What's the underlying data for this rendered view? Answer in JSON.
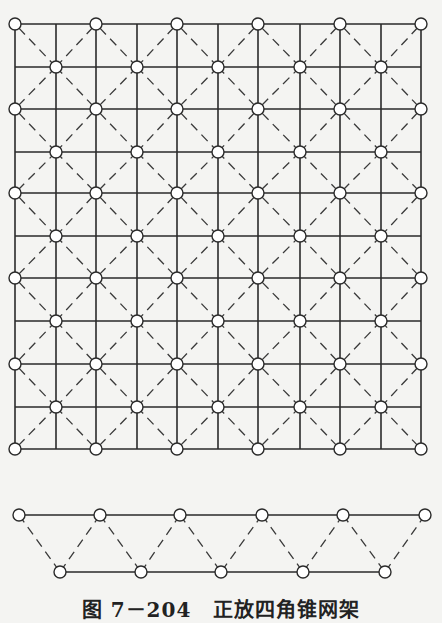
{
  "figure": {
    "caption_number": "图 7－204",
    "caption_title": "正放四角锥网架",
    "colors": {
      "line": "#2a2a2a",
      "node_fill": "#ffffff",
      "background": "#f4f4f2"
    }
  },
  "plan_view": {
    "description": "Plan view of square-pyramid space grid: upper chord grid (solid), lower chord nodes offset (inner), web members dashed",
    "outer_x": [
      15,
      96,
      177,
      258,
      340,
      421
    ],
    "outer_y": [
      24,
      109,
      193,
      278,
      364,
      449
    ],
    "inner_x": [
      56,
      137,
      218,
      300,
      381
    ],
    "inner_y": [
      67,
      152,
      236,
      321,
      407
    ],
    "node_radius": 6
  },
  "elevation_view": {
    "description": "Elevation of truss: top chord, bottom chord, dashed web diagonals",
    "top_y": 515,
    "bottom_y": 572,
    "top_x": [
      19,
      100,
      180,
      262,
      343,
      425
    ],
    "bottom_x": [
      60,
      141,
      221,
      303,
      385
    ],
    "node_radius": 6
  }
}
